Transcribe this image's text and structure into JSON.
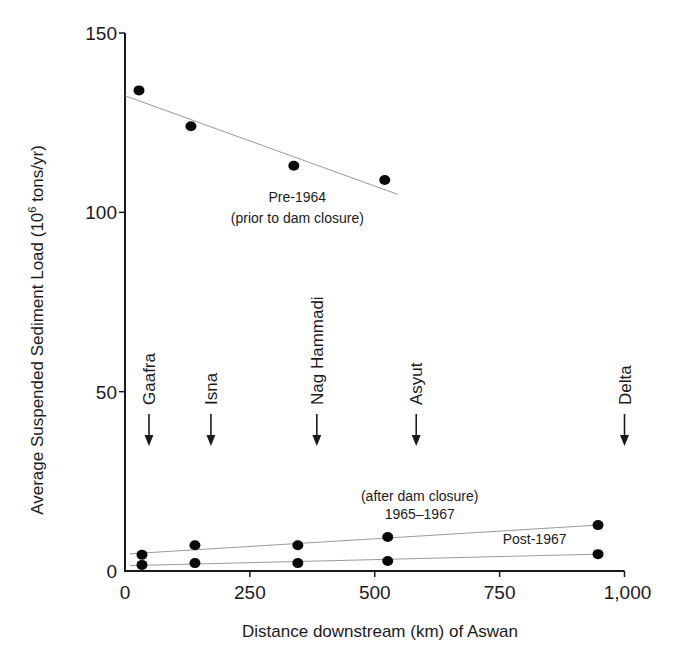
{
  "chart_data": {
    "type": "scatter",
    "title": "",
    "xlabel": "Distance downstream (km) of Aswan",
    "ylabel": "Average Suspended Sediment Load (10^6 tons/yr)",
    "ylabel_parts": {
      "main": "Average Suspended Sediment Load (10",
      "sup": "6",
      "tail": " tons/yr)"
    },
    "xlim": [
      0,
      1000
    ],
    "ylim": [
      0,
      150
    ],
    "x_ticks": [
      0,
      250,
      500,
      750,
      1000
    ],
    "x_tick_labels": [
      "0",
      "250",
      "500",
      "750",
      "1,000"
    ],
    "y_ticks": [
      0,
      50,
      100,
      150
    ],
    "y_tick_labels": [
      "0",
      "50",
      "100",
      "150"
    ],
    "grid": false,
    "legend": "none (inline annotations)",
    "series": [
      {
        "name": "Pre-1964 (prior to dam closure)",
        "x": [
          28,
          132,
          338,
          520
        ],
        "y": [
          134,
          124,
          113,
          109
        ],
        "trendline": {
          "x": [
            0,
            546
          ],
          "y": [
            132.5,
            105
          ]
        }
      },
      {
        "name": "1965–1967 (after dam closure)",
        "x": [
          34,
          140,
          346,
          526,
          947
        ],
        "y": [
          4.5,
          7.2,
          7.2,
          9.5,
          12.8
        ],
        "trendline": {
          "x": [
            10,
            947
          ],
          "y": [
            4.8,
            12.8
          ]
        }
      },
      {
        "name": "Post-1967",
        "x": [
          34,
          140,
          346,
          526,
          947
        ],
        "y": [
          1.7,
          2.2,
          2.2,
          2.8,
          4.7
        ],
        "trendline": {
          "x": [
            10,
            947
          ],
          "y": [
            1.5,
            4.7
          ]
        }
      }
    ],
    "annotations": [
      {
        "text": "Pre-1964",
        "x": 345,
        "y": 103
      },
      {
        "text": "(prior to dam closure)",
        "x": 345,
        "y": 97
      },
      {
        "text": "(after dam closure)",
        "x": 590,
        "y": 19.5
      },
      {
        "text": "1965–1967",
        "x": 590,
        "y": 14.5
      },
      {
        "text": "Post-1967",
        "x": 820,
        "y": 7.5
      }
    ],
    "stations": [
      {
        "name": "Gaafra",
        "x": 48
      },
      {
        "name": "Isna",
        "x": 172
      },
      {
        "name": "Nag Hammadi",
        "x": 384
      },
      {
        "name": "Asyut",
        "x": 583
      },
      {
        "name": "Delta",
        "x": 1000
      }
    ]
  },
  "colors": {
    "axis": "#1a1a1a",
    "point": "#0a0a0a",
    "trendline": "#9a9a9a",
    "text": "#1a1a1a"
  }
}
